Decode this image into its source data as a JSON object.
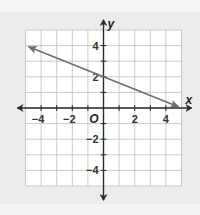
{
  "chart_data": {
    "type": "line",
    "title": "",
    "xlabel": "x",
    "ylabel": "y",
    "origin_label": "O",
    "xlim": [
      -5,
      5
    ],
    "ylim": [
      -5,
      5
    ],
    "grid": true,
    "grid_step": 1,
    "x_ticks": [
      -4,
      -2,
      2,
      4
    ],
    "y_ticks": [
      4,
      2,
      -2,
      -4
    ],
    "x_tick_labels": [
      "−4",
      "−2",
      "2",
      "4"
    ],
    "y_tick_labels": [
      "4",
      "2",
      "−2",
      "−4"
    ],
    "series": [
      {
        "name": "line",
        "slope": -0.4,
        "intercept": 2,
        "x": [
          -4.8,
          4.8
        ],
        "y": [
          3.92,
          0.08
        ],
        "arrows": "both",
        "color": "#6f6f6f"
      }
    ]
  },
  "colors": {
    "background": "#ececec",
    "plot_background": "#ffffff",
    "grid": "#bdbdbd",
    "axis": "#2a2a2a"
  }
}
